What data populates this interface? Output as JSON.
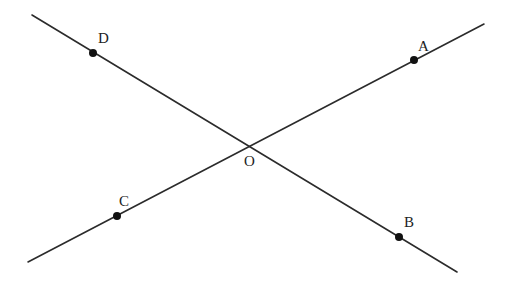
{
  "figure": {
    "title": "",
    "line_color": "#2b2b2b",
    "point_color": "#111111"
  },
  "lines": [
    {
      "name": "line-DB",
      "from": [
        32,
        15
      ],
      "to": [
        457,
        272
      ],
      "through": [
        "D",
        "O",
        "B"
      ]
    },
    {
      "name": "line-CA",
      "from": [
        28,
        262
      ],
      "to": [
        484,
        24
      ],
      "through": [
        "C",
        "O",
        "A"
      ]
    }
  ],
  "points": {
    "A": {
      "label": "A",
      "x": 414,
      "y": 60,
      "label_x": 418,
      "label_y": 51,
      "dot": true
    },
    "B": {
      "label": "B",
      "x": 399,
      "y": 237,
      "label_x": 404,
      "label_y": 227,
      "dot": true
    },
    "C": {
      "label": "C",
      "x": 117,
      "y": 216,
      "label_x": 119,
      "label_y": 206,
      "dot": true
    },
    "D": {
      "label": "D",
      "x": 93,
      "y": 53,
      "label_x": 98,
      "label_y": 43,
      "dot": true
    },
    "O": {
      "label": "O",
      "x": 251,
      "y": 148,
      "label_x": 244,
      "label_y": 166,
      "dot": false
    }
  }
}
